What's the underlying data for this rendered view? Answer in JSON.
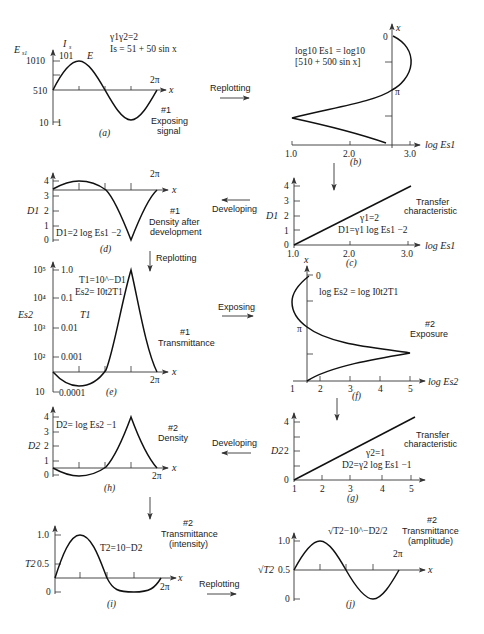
{
  "figure": {
    "panels": {
      "a": {
        "label": "(a)",
        "y_axis_left": "E",
        "y_axis_left_sub": "s1",
        "y_axis_right": "I",
        "y_axis_right_sub": "s",
        "y_ticks_left": [
          "1010",
          "510",
          "10"
        ],
        "y_ticks_right": [
          "101",
          "1"
        ],
        "x_axis": "x",
        "x_end": "2π",
        "curve_label": "E",
        "eq1": "γ1γ2=2",
        "eq2": "Is = 51 + 50 sin x",
        "caption_num": "#1",
        "caption1": "Exposing",
        "caption2": "signal"
      },
      "b": {
        "label": "(b)",
        "eq1": "log10 Es1 = log10",
        "eq2": "[510 + 500 sin x]",
        "x_axis": "log Es1",
        "x_ticks": [
          "1.0",
          "2.0",
          "3.0"
        ],
        "y_axis": "x",
        "y_ticks": [
          "0",
          "π"
        ]
      },
      "c": {
        "label": "(c)",
        "y_axis": "D1",
        "y_ticks": [
          "0",
          "1",
          "2",
          "3",
          "4"
        ],
        "x_axis": "log Es1",
        "x_ticks": [
          "1.0",
          "2.0",
          "3.0"
        ],
        "eq1": "γ1=2",
        "eq2": "D1=γ1 log Es1 −2",
        "caption1": "Transfer",
        "caption2": "characteristic"
      },
      "d": {
        "label": "(d)",
        "y_axis": "D1",
        "y_ticks": [
          "0",
          "1",
          "2",
          "3",
          "4"
        ],
        "x_axis": "x",
        "x_end": "2π",
        "eq": "D1=2 log Es1 −2",
        "caption_num": "#1",
        "caption1": "Density after",
        "caption2": "development"
      },
      "e": {
        "label": "(e)",
        "y_axis_left": "Es2",
        "y_ticks_left": [
          "10⁵",
          "10⁴",
          "10³",
          "10²",
          "10"
        ],
        "y_axis_right": "T1",
        "y_ticks_right": [
          "1.0",
          "0.1",
          "0.01",
          "0.001",
          "0.0001"
        ],
        "x_axis": "x",
        "x_end": "2π",
        "eq1": "T1=10^−D1",
        "eq2": "Es2= I0t2T1",
        "caption_num": "#1",
        "caption1": "Transmittance"
      },
      "f": {
        "label": "(f)",
        "eq": "log Es2 = log I0t2T1",
        "x_axis": "log Es2",
        "x_ticks": [
          "1",
          "2",
          "3",
          "4",
          "5"
        ],
        "y_axis": "x",
        "y_ticks": [
          "0",
          "π"
        ],
        "caption_num": "#2",
        "caption1": "Exposure"
      },
      "g": {
        "label": "(g)",
        "y_axis": "D2",
        "y_ticks": [
          "0",
          "2",
          "4"
        ],
        "x_ticks": [
          "1",
          "2",
          "3",
          "4",
          "5"
        ],
        "eq1": "γ2=1",
        "eq2": "D2=γ2 log Es1 −1",
        "caption1": "Transfer",
        "caption2": "characteristic"
      },
      "h": {
        "label": "(h)",
        "y_axis": "D2",
        "y_ticks": [
          "0",
          "1",
          "2",
          "3",
          "4"
        ],
        "x_axis": "x",
        "x_end": "2π",
        "eq": "D2= log Es2 −1",
        "caption_num": "#2",
        "caption1": "Density"
      },
      "i": {
        "label": "(i)",
        "y_axis": "T2",
        "y_ticks": [
          "0",
          "0.5",
          "1.0"
        ],
        "x_axis": "x",
        "x_end": "2π",
        "eq": "T2=10−D2",
        "caption_num": "#2",
        "caption1": "Transmittance",
        "caption2": "(intensity)"
      },
      "j": {
        "label": "(j)",
        "y_axis": "√T2",
        "y_ticks": [
          "0",
          "0.5",
          "1.0"
        ],
        "x_axis": "x",
        "x_end": "2π",
        "eq": "√T2−10^−D2/2",
        "caption_num": "#2",
        "caption1": "Transmittance",
        "caption2": "(amplitude)"
      }
    },
    "arrows": {
      "a_to_b": "Replotting",
      "c_to_d": "Developing",
      "d_to_e": "Replotting",
      "e_to_f": "Exposing",
      "g_to_h": "Developing",
      "i_to_j": "Replotting"
    }
  }
}
